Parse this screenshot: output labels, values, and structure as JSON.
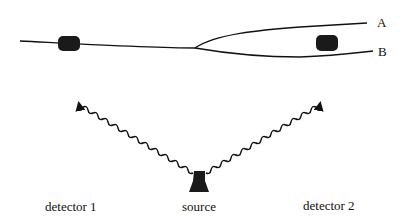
{
  "diagram": {
    "type": "physics-schematic",
    "colors": {
      "ink": "#111111",
      "device": "#1a1a1a",
      "background": "#ffffff"
    },
    "nodes": [
      {
        "id": "detector1",
        "label": "detector 1",
        "shape": "rounded-cylinder"
      },
      {
        "id": "source",
        "label": "source",
        "shape": "bell-trapezoid"
      },
      {
        "id": "detector2",
        "label": "detector 2",
        "shape": "rounded-cylinder"
      }
    ],
    "paths": [
      {
        "id": "path-A",
        "label": "A"
      },
      {
        "id": "path-B",
        "label": "B"
      }
    ],
    "edges": [
      {
        "from": "source",
        "to": "detector1",
        "style": "wavy-arrow"
      },
      {
        "from": "source",
        "to": "detector2",
        "style": "wavy-arrow"
      }
    ]
  },
  "labels": {
    "detector1": "detector 1",
    "source": "source",
    "detector2": "detector 2",
    "branch_a": "A",
    "branch_b": "B"
  }
}
